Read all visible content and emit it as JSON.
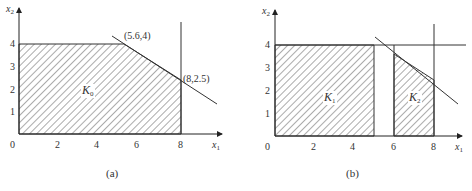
{
  "panels": [
    {
      "id": "a",
      "caption": "(a)",
      "x_axis_label": "x",
      "x_axis_sub": "1",
      "y_axis_label": "x",
      "y_axis_sub": "2",
      "origin_label": "0",
      "x_ticks": [
        "2",
        "4",
        "6",
        "8"
      ],
      "y_ticks": [
        "1",
        "2",
        "3",
        "4"
      ],
      "region_label": "K",
      "region_sub": "0",
      "points": [
        {
          "label": "(5.6,4)",
          "x": 5.6,
          "y": 4
        },
        {
          "label": "(8,2.5)",
          "x": 8,
          "y": 2.5
        }
      ]
    },
    {
      "id": "b",
      "caption": "(b)",
      "x_axis_label": "x",
      "x_axis_sub": "1",
      "y_axis_label": "x",
      "y_axis_sub": "2",
      "origin_label": "0",
      "x_ticks": [
        "2",
        "4",
        "6",
        "8"
      ],
      "y_ticks": [
        "1",
        "2",
        "3",
        "4"
      ],
      "regions": [
        {
          "label": "K",
          "sub": "1"
        },
        {
          "label": "K",
          "sub": "2"
        }
      ]
    }
  ],
  "colors": {
    "line": "#333333",
    "hatch": "#444444",
    "background": "#ffffff"
  }
}
